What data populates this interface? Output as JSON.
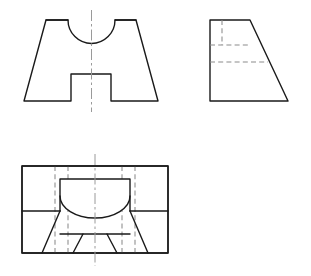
{
  "sheet": {
    "title": "Orthographic Multiview Drawing",
    "width": 311,
    "height": 276,
    "background_color": "#ffffff",
    "visible_line_color": "#1a1a1a",
    "hidden_line_color": "#8c8c8c",
    "center_line_color": "#9a9a9a"
  },
  "views": {
    "front": {
      "name": "Front View",
      "outline_points": "46,20 136,20 158,101 111,101 111,74 71,74 71,101 24,101",
      "notch_top_left": "71,74",
      "notch_top_right": "111,74",
      "arc_path": "M 68,20 A 23.5,23.5 0 0 0 115,20",
      "arc_center_x": 91.5,
      "arc_center_y": 20,
      "arc_radius": 23.5,
      "center_line": "91.5,10 91.5,112",
      "top_edge_y": 20,
      "bottom_edge_y": 101,
      "top_left_x": 46,
      "top_right_x": 136,
      "bottom_left_x": 24,
      "bottom_right_x": 158
    },
    "side": {
      "name": "Right Side View",
      "outline_points": "210,20 250,20 288,101 210,101",
      "hidden_vertical": "222,20 222,45",
      "hidden_horizontal_upper": "210,45 250,45",
      "hidden_horizontal_lower": "210,62 268,62",
      "top_edge_y": 20,
      "bottom_edge_y": 101,
      "left_edge_x": 210,
      "top_right_x": 250,
      "bottom_right_x": 288
    },
    "top": {
      "name": "Top View",
      "outer_rect": "22,166 168,166 168,253 22,253",
      "outer_left_x": 22,
      "outer_right_x": 168,
      "outer_top_y": 166,
      "outer_bottom_y": 253,
      "inner_pocket": "60,179 130,179 130,211 60,211",
      "left_taper": "60,211 42,253 22,253",
      "right_taper": "130,211 148,253 168,253",
      "left_slot": "60,234 83,234 73,253 60,253",
      "right_slot": "130,234 107,234 117,253 130,253",
      "arc_path": "M 60,196 A 35,22 0 0 0 130,196",
      "center_line": "95,154 95,266",
      "hidden_verticals": [
        "55,166 55,253",
        "68,166 68,253",
        "122,166 122,253",
        "135,166 135,253"
      ],
      "hidden_arc_ref": "95,166 95,253"
    }
  },
  "annotations": {
    "view_count": 3,
    "projection": "third-angle style layout",
    "labels_visible": false
  }
}
